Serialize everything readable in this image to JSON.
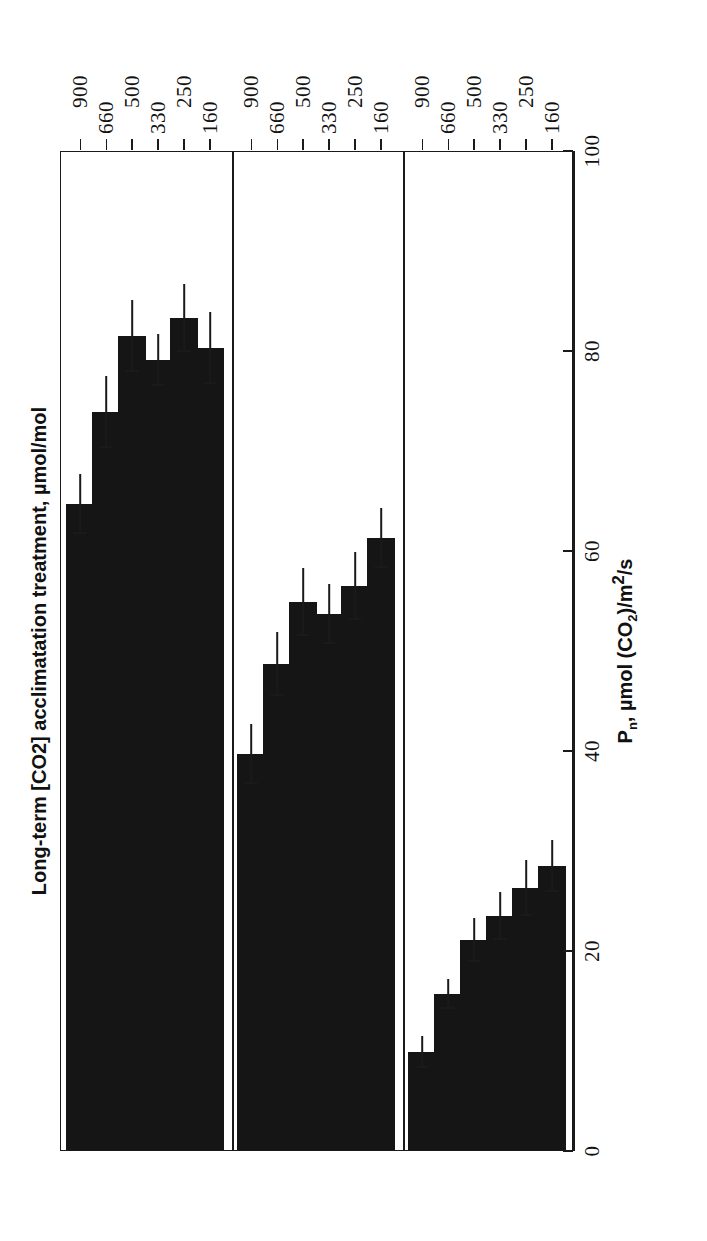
{
  "figure": {
    "orientation": "rotated-90",
    "background": "#ffffff",
    "ink_color": "#151515"
  },
  "chart_data": {
    "type": "bar",
    "title": "",
    "subtitle": "",
    "orientation": "horizontal-rotated",
    "xlabel": "Long-term [CO2] acclimatation treatment, µmol/mol",
    "ylabel": "Pₙ, µmol (CO₂)/m²/s",
    "ylim": [
      0,
      100
    ],
    "yticks": [
      0,
      20,
      40,
      60,
      80,
      100
    ],
    "ytick_labels": [
      "0",
      "20",
      "40",
      "60",
      "80",
      "100"
    ],
    "grid": false,
    "legend": "none",
    "categories": [
      "160",
      "250",
      "330",
      "500",
      "660",
      "900"
    ],
    "panels": [
      {
        "title_prefix": "AM [CO",
        "title_sub": "2",
        "title_suffix": "]: 160",
        "title_full": "AM [CO2]: 160",
        "measurement_co2": 160,
        "values": [
          28.4,
          26.2,
          23.4,
          21.0,
          15.6,
          9.8
        ],
        "errors": [
          2.6,
          2.8,
          2.4,
          2.2,
          1.5,
          1.6
        ]
      },
      {
        "title_prefix": "AM [CO",
        "title_sub": "2",
        "title_suffix": "]: 330",
        "title_full": "AM [CO2]: 330",
        "measurement_co2": 330,
        "values": [
          61.2,
          56.4,
          53.6,
          54.8,
          48.6,
          39.6
        ],
        "errors": [
          3.0,
          3.4,
          3.0,
          3.4,
          3.2,
          3.0
        ]
      },
      {
        "title_prefix": "AM [CO",
        "title_sub": "2",
        "title_suffix": "]: 660",
        "title_full": "AM [CO2]: 660",
        "measurement_co2": 660,
        "values": [
          80.2,
          83.2,
          79.0,
          81.4,
          73.8,
          64.6
        ],
        "errors": [
          3.6,
          3.4,
          2.6,
          3.6,
          3.6,
          3.0
        ]
      }
    ]
  },
  "axes": {
    "value_axis_title_main": "P",
    "value_axis_title_sub": "n",
    "value_axis_title_rest": ", µmol (CO",
    "value_axis_title_sub2": "2",
    "value_axis_title_rest2": ")/m",
    "value_axis_title_sup": "2",
    "value_axis_title_rest3": "/s",
    "category_axis_title": "Long-term [CO2] acclimatation treatment, µmol/mol"
  }
}
